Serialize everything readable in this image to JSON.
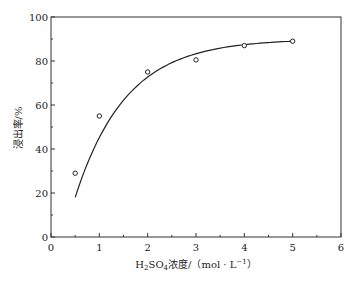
{
  "chart_data": {
    "type": "line",
    "title": "",
    "xlabel": "H2SO4浓度/（mol·L⁻¹）",
    "ylabel": "浸出率/%",
    "xlim": [
      0,
      6
    ],
    "ylim": [
      0,
      100
    ],
    "x_ticks": [
      0,
      1,
      2,
      3,
      4,
      5,
      6
    ],
    "y_ticks": [
      0,
      20,
      40,
      60,
      80,
      100
    ],
    "grid": false,
    "legend": null,
    "series": [
      {
        "name": "浸出率",
        "marker": "open-circle",
        "line": "smooth-fit",
        "x": [
          0.5,
          1,
          2,
          3,
          4,
          5
        ],
        "y": [
          29,
          55,
          75,
          80.5,
          87,
          89
        ]
      }
    ]
  },
  "labels": {
    "ylabel": "浸出率/%",
    "xlabel_prefix": "H",
    "xlabel_sub2": "2",
    "xlabel_so": "SO",
    "xlabel_sub4": "4",
    "xlabel_rest": "浓度/（mol · L",
    "xlabel_sup": "−1",
    "xlabel_end": "）"
  }
}
